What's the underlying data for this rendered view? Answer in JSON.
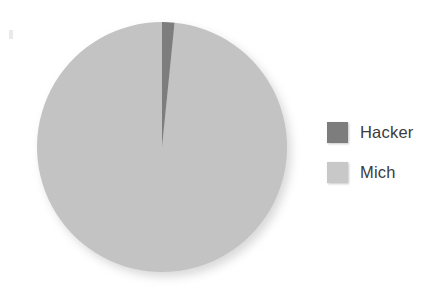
{
  "canvas": {
    "width": 437,
    "height": 306,
    "background": "#ffffff"
  },
  "chart_data": {
    "type": "pie",
    "title": "",
    "categories": [
      "Hacker",
      "Mich"
    ],
    "values": [
      1.6,
      98.4
    ],
    "unit": "percent",
    "colors": [
      "#7d7d7d",
      "#c3c3c3"
    ],
    "start_angle_deg": 0,
    "direction": "clockwise",
    "labels_shown": false,
    "grid": false,
    "legend": {
      "position": "right",
      "entries": [
        {
          "label": "Hacker",
          "color": "#7d7d7d"
        },
        {
          "label": "Mich",
          "color": "#c8c8c8"
        }
      ]
    },
    "geometry": {
      "center_x": 162,
      "center_y": 147,
      "radius": 125
    }
  },
  "legend": {
    "entries": [
      {
        "label": "Hacker",
        "swatch_color": "#7d7d7d"
      },
      {
        "label": "Mich",
        "swatch_color": "#c8c8c8"
      }
    ]
  }
}
